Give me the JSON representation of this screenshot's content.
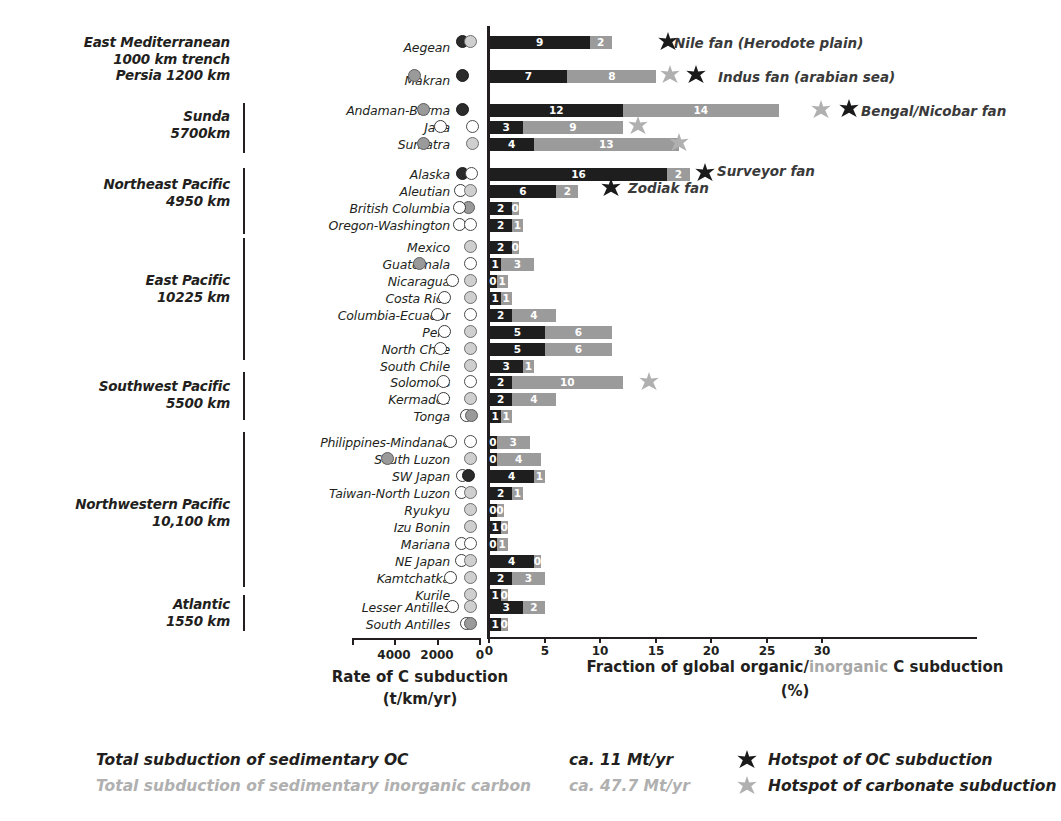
{
  "chart_data": {
    "type": "bar",
    "title": "",
    "xlabel": "Fraction of global organic/inorganic C subduction (%)",
    "ylabel": "",
    "xlim": [
      0,
      34
    ],
    "xticks": [
      0,
      5,
      10,
      15,
      20,
      25,
      30
    ],
    "xtick_labels": [
      "0",
      "5",
      "10",
      "15",
      "20",
      "25",
      "30"
    ],
    "grid": false,
    "legend_position": "bottom",
    "series": [
      {
        "name": "Organic carbon (OC)",
        "color": "#1e1e1e"
      },
      {
        "name": "Inorganic carbon",
        "color": "#9b9b9b"
      }
    ],
    "categories": [
      "Aegean",
      "Makran",
      "Andaman-Burma",
      "Java",
      "Sumatra",
      "Alaska",
      "Aleutian",
      "British Columbia",
      "Oregon-Washington",
      "Mexico",
      "Guatemala",
      "Nicaragua",
      "Costa Rica",
      "Columbia-Ecuador",
      "Peru",
      "North Chile",
      "South Chile",
      "Solomons",
      "Kermadec",
      "Tonga",
      "Philippines-Mindanao",
      "South Luzon",
      "SW Japan",
      "Taiwan-North Luzon",
      "Ryukyu",
      "Izu Bonin",
      "Mariana",
      "NE Japan",
      "Kamtchatka",
      "Kurile",
      "Lesser Antilles",
      "South Antilles"
    ],
    "organic_values": [
      9,
      7,
      12,
      3,
      4,
      16,
      6,
      2,
      2,
      2,
      1,
      0,
      1,
      2,
      5,
      5,
      3,
      2,
      2,
      1,
      0,
      0,
      4,
      2,
      0,
      1,
      0,
      4,
      2,
      1,
      3,
      1
    ],
    "inorganic_values": [
      2,
      8,
      14,
      9,
      13,
      2,
      2,
      0,
      1,
      0,
      3,
      1,
      1,
      4,
      6,
      6,
      1,
      10,
      4,
      1,
      3,
      4,
      1,
      1,
      0,
      0,
      1,
      0,
      3,
      0,
      2,
      0
    ]
  },
  "regions": [
    {
      "lines": [
        "East Mediterranean",
        "1000 km trench",
        "Persia 1200 km"
      ],
      "bracket": false
    },
    {
      "lines": [
        "Sunda",
        "5700km"
      ],
      "bracket": true
    },
    {
      "lines": [
        "Northeast Pacific",
        "4950 km"
      ],
      "bracket": true
    },
    {
      "lines": [
        "East Pacific",
        "10225 km"
      ],
      "bracket": true
    },
    {
      "lines": [
        "Southwest Pacific",
        "5500 km"
      ],
      "bracket": true
    },
    {
      "lines": [
        "Northwestern Pacific",
        "10,100 km"
      ],
      "bracket": true
    },
    {
      "lines": [
        "Atlantic",
        "1550 km"
      ],
      "bracket": true
    }
  ],
  "rate_axis": {
    "ticks": [
      "4000",
      "2000",
      "0"
    ],
    "caption_line1": "Rate of C subduction",
    "caption_line2": "(t/km/yr)"
  },
  "x_axis": {
    "caption_pre": "Fraction of global ",
    "caption_organic": "organic",
    "caption_slash": "/",
    "caption_inorganic": "inorganic",
    "caption_post": " C subduction",
    "caption_units": "(%)"
  },
  "fan_annotations": [
    {
      "label": "Nile fan (Herodote plain)"
    },
    {
      "label": "Indus fan (arabian sea)"
    },
    {
      "label": "Bengal/Nicobar fan"
    },
    {
      "label": "Surveyor fan"
    },
    {
      "label": "Zodiak fan"
    }
  ],
  "legend": {
    "oc_text": "Total subduction of sedimentary OC",
    "oc_value": "ca. 11 Mt/yr",
    "ic_text": "Total subduction of sedimentary inorganic carbon",
    "ic_value": "ca. 47.7 Mt/yr",
    "hotspot_oc": "Hotspot of OC subduction",
    "hotspot_carbonate": "Hotspot of carbonate subduction"
  },
  "colors": {
    "organic": "#1e1e1e",
    "inorganic": "#9b9b9b",
    "text": "#231f20",
    "gray_text": "#b0b0b0"
  }
}
